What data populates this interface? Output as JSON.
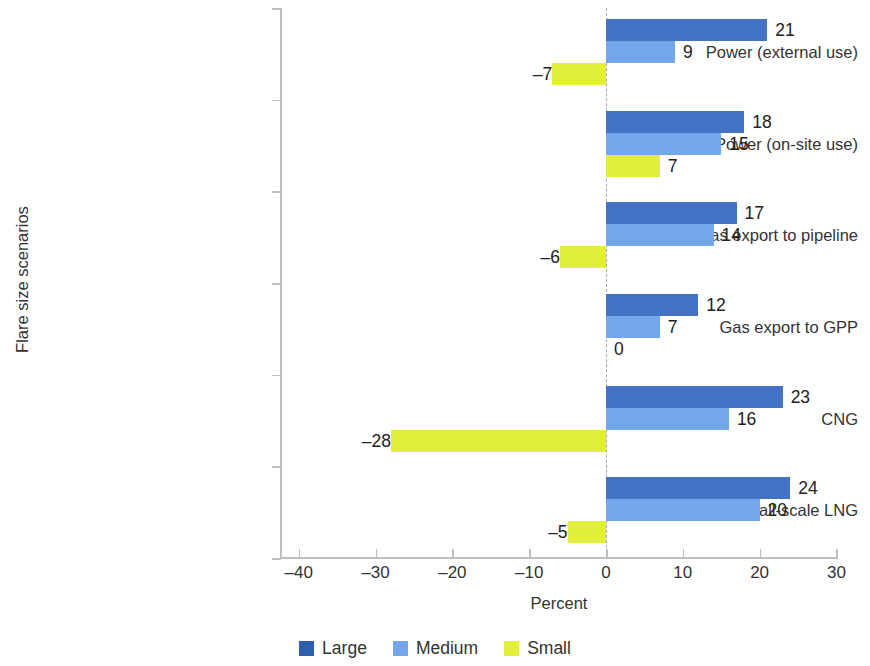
{
  "chart_data": {
    "type": "bar",
    "orientation": "horizontal",
    "title": "",
    "xlabel": "Percent",
    "ylabel": "Flare size scenarios",
    "xlim": [
      -45,
      32
    ],
    "xticks": [
      -40,
      -30,
      -20,
      -10,
      0,
      10,
      20,
      30
    ],
    "xtick_labels": [
      "–40",
      "–30",
      "–20",
      "–10",
      "0",
      "10",
      "20",
      "30"
    ],
    "grid": false,
    "zero_reference_line": true,
    "legend_position": "bottom",
    "categories": [
      "Power (external use)",
      "Power (on-site use)",
      "Gas export to pipeline",
      "Gas export to GPP",
      "CNG",
      "Small-scale LNG"
    ],
    "series": [
      {
        "name": "Large",
        "color": "#4472C4",
        "values": [
          21,
          18,
          17,
          12,
          23,
          24
        ],
        "labels": [
          "21",
          "18",
          "17",
          "12",
          "23",
          "24"
        ]
      },
      {
        "name": "Medium",
        "color": "#73A7EA",
        "values": [
          9,
          15,
          14,
          7,
          16,
          20
        ],
        "labels": [
          "9",
          "15",
          "14",
          "7",
          "16",
          "20"
        ]
      },
      {
        "name": "Small",
        "color": "#E2EE3C",
        "values": [
          -7,
          7,
          -6,
          0,
          -28,
          -5
        ],
        "labels": [
          "–7",
          "7",
          "–6",
          "0",
          "–28",
          "–5"
        ]
      }
    ]
  },
  "legend": {
    "items": [
      {
        "label": "Large",
        "color": "#2E5FAE"
      },
      {
        "label": "Medium",
        "color": "#73A7EA"
      },
      {
        "label": "Small",
        "color": "#E2EE3C"
      }
    ]
  }
}
